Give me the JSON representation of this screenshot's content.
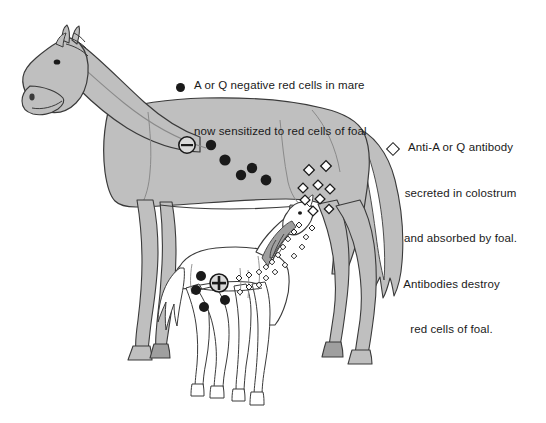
{
  "figure": {
    "background_color": "#ffffff",
    "ink_color": "#1a1a1a",
    "mare_fill_color": "#bfbfbf",
    "foal_fill_color": "#ffffff",
    "outline_color": "#3a3a3a"
  },
  "callouts": {
    "mare": {
      "marker": "filled-circle",
      "marker_name": "filled-red-cell-marker",
      "line1": "A or Q negative red cells in mare",
      "line2": "now sensitized to red cells of foal"
    },
    "foal": {
      "marker": "open-diamond",
      "marker_name": "open-antibody-marker",
      "line1": "Anti-A or Q antibody",
      "line2": "secreted in colostrum",
      "line3": "and absorbed by foal.",
      "line4": "Antibodies destroy",
      "line5": "red cells of foal."
    }
  },
  "symbols": {
    "mare_sign": "–",
    "mare_sign_name": "negative-sign-badge",
    "foal_sign": "+",
    "foal_sign_name": "positive-sign-badge"
  },
  "markers": {
    "mare_red_cells": [
      {
        "cx": 211,
        "cy": 145,
        "r": 5.2
      },
      {
        "cx": 225,
        "cy": 160,
        "r": 5.6
      },
      {
        "cx": 241,
        "cy": 175,
        "r": 5.2
      },
      {
        "cx": 231,
        "cy": 175,
        "r": 0
      },
      {
        "cx": 252,
        "cy": 168,
        "r": 5.2
      },
      {
        "cx": 266,
        "cy": 180,
        "r": 5.4
      }
    ],
    "mare_antibodies": [
      {
        "cx": 309,
        "cy": 170,
        "s": 7.5
      },
      {
        "cx": 326,
        "cy": 166,
        "s": 7.5
      },
      {
        "cx": 303,
        "cy": 188,
        "s": 7.0
      },
      {
        "cx": 318,
        "cy": 185,
        "s": 7.0
      },
      {
        "cx": 330,
        "cy": 189,
        "s": 7.0
      },
      {
        "cx": 305,
        "cy": 200,
        "s": 7.0
      },
      {
        "cx": 320,
        "cy": 199,
        "s": 7.0
      },
      {
        "cx": 313,
        "cy": 211,
        "s": 7.0
      },
      {
        "cx": 329,
        "cy": 209,
        "s": 6.6
      }
    ],
    "foal_red_cells": [
      {
        "cx": 201,
        "cy": 276,
        "r": 5.0
      },
      {
        "cx": 196,
        "cy": 290,
        "r": 5.0
      },
      {
        "cx": 204,
        "cy": 307,
        "r": 5.0
      },
      {
        "cx": 225,
        "cy": 300,
        "r": 5.0
      }
    ],
    "foal_antibodies": [
      {
        "cx": 299,
        "cy": 225,
        "s": 4.2
      },
      {
        "cx": 294,
        "cy": 232,
        "s": 4.2
      },
      {
        "cx": 288,
        "cy": 239,
        "s": 4.0
      },
      {
        "cx": 283,
        "cy": 247,
        "s": 4.0
      },
      {
        "cx": 278,
        "cy": 255,
        "s": 4.0
      },
      {
        "cx": 272,
        "cy": 262,
        "s": 4.0
      },
      {
        "cx": 266,
        "cy": 267,
        "s": 4.0
      },
      {
        "cx": 259,
        "cy": 272,
        "s": 4.0
      },
      {
        "cx": 249,
        "cy": 275,
        "s": 4.2
      },
      {
        "cx": 239,
        "cy": 278,
        "s": 4.2
      },
      {
        "cx": 249,
        "cy": 287,
        "s": 4.2
      },
      {
        "cx": 259,
        "cy": 285,
        "s": 4.0
      },
      {
        "cx": 240,
        "cy": 292,
        "s": 4.0
      },
      {
        "cx": 266,
        "cy": 278,
        "s": 4.0
      },
      {
        "cx": 275,
        "cy": 272,
        "s": 4.0
      },
      {
        "cx": 285,
        "cy": 265,
        "s": 4.0
      },
      {
        "cx": 294,
        "cy": 256,
        "s": 4.0
      },
      {
        "cx": 302,
        "cy": 247,
        "s": 4.0
      },
      {
        "cx": 306,
        "cy": 237,
        "s": 4.0
      },
      {
        "cx": 312,
        "cy": 228,
        "s": 4.2
      }
    ]
  }
}
